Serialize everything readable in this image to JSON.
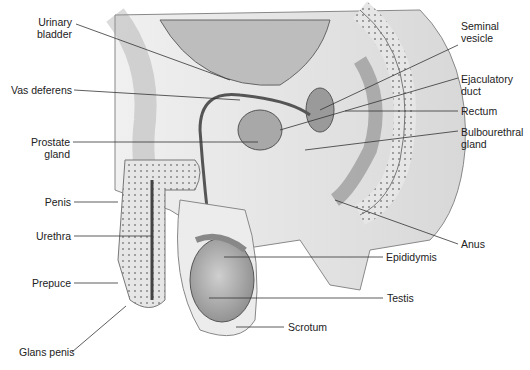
{
  "diagram": {
    "labels_left": [
      {
        "id": "urinary-bladder",
        "text": "Urinary\nbladder",
        "x": 30,
        "y": 18
      },
      {
        "id": "vas-deferens",
        "text": "Vas deferens",
        "x": 6,
        "y": 84
      },
      {
        "id": "prostate-gland",
        "text": "Prostate\ngland",
        "x": 32,
        "y": 137
      },
      {
        "id": "penis",
        "text": "Penis",
        "x": 45,
        "y": 196
      },
      {
        "id": "urethra",
        "text": "Urethra",
        "x": 35,
        "y": 230
      },
      {
        "id": "prepuce",
        "text": "Prepuce",
        "x": 34,
        "y": 278
      },
      {
        "id": "glans-penis",
        "text": "Glans penis",
        "x": 18,
        "y": 346
      }
    ],
    "labels_right": [
      {
        "id": "seminal-vesicle",
        "text": "Seminal\nvesicle",
        "x": 460,
        "y": 22
      },
      {
        "id": "ejaculatory-duct",
        "text": "Ejaculatory\nduct",
        "x": 460,
        "y": 77
      },
      {
        "id": "rectum",
        "text": "Rectum",
        "x": 460,
        "y": 104
      },
      {
        "id": "bulbourethral-gland",
        "text": "Bulbourethral\ngland",
        "x": 460,
        "y": 128
      },
      {
        "id": "anus",
        "text": "Anus",
        "x": 460,
        "y": 237
      },
      {
        "id": "epididymis",
        "text": "Epididymis",
        "x": 386,
        "y": 251
      },
      {
        "id": "testis",
        "text": "Testis",
        "x": 387,
        "y": 292
      },
      {
        "id": "scrotum",
        "text": "Scrotum",
        "x": 288,
        "y": 321
      }
    ]
  }
}
